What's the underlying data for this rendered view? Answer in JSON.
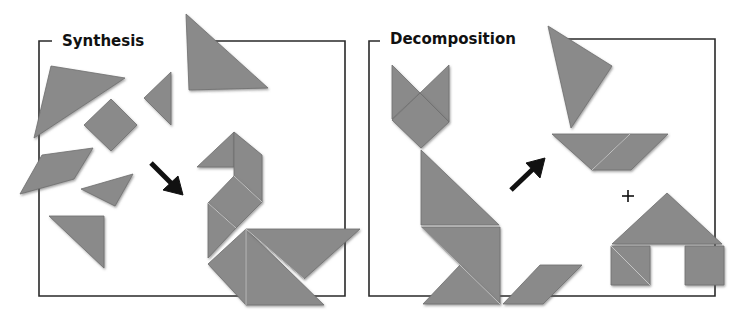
{
  "panels": [
    {
      "id": "synthesis",
      "title": "Synthesis",
      "description": "Scattered tangram pieces assembled into a swan figure",
      "arrow_direction": "down-right"
    },
    {
      "id": "decomposition",
      "title": "Decomposition",
      "description": "A cat tangram figure broken apart into a sailboat plus a house",
      "arrow_direction": "up-right",
      "operator": "+"
    }
  ],
  "colors": {
    "piece_fill": "#8a8a8a",
    "piece_edge": "#6e6e6e",
    "frame": "#2a2a2a",
    "arrow": "#111111",
    "background": "#ffffff"
  }
}
